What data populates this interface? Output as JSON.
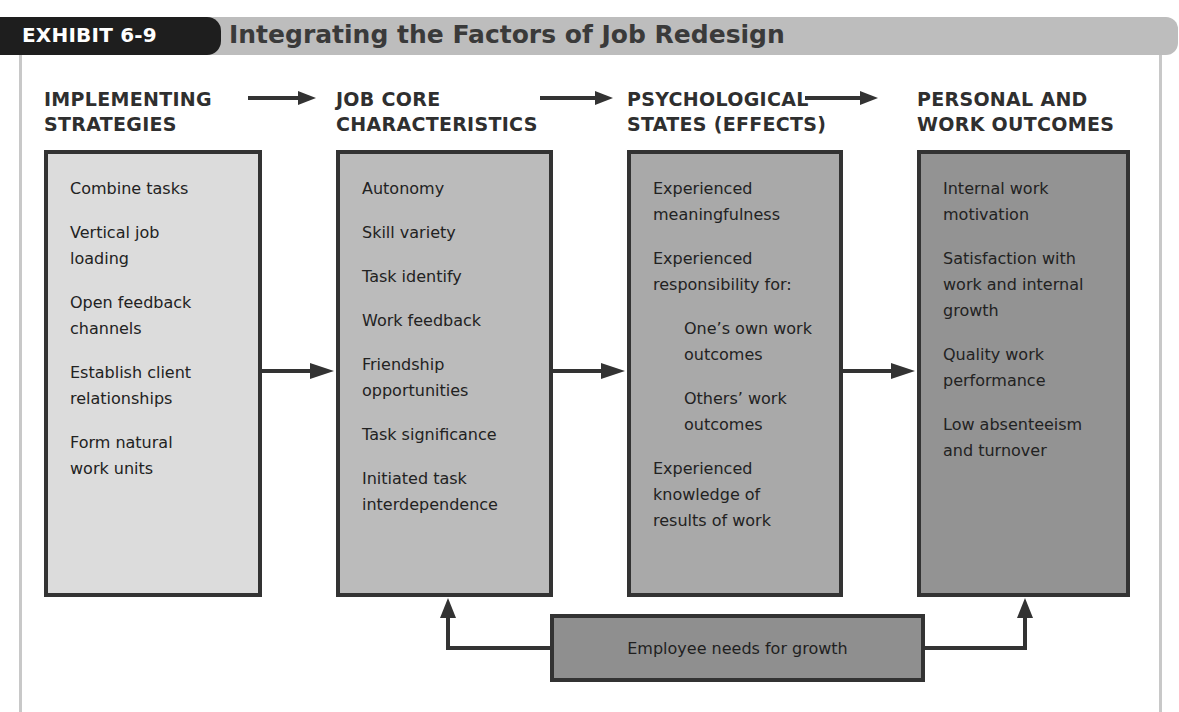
{
  "header": {
    "exhibit_label": "EXHIBIT 6-9",
    "title": "Integrating the Factors of Job Redesign"
  },
  "columns": [
    {
      "heading": "IMPLEMENTING\nSTRATEGIES",
      "items": [
        "Combine tasks",
        "Vertical job\nloading",
        "Open feedback\nchannels",
        "Establish client\nrelationships",
        "Form natural\nwork units"
      ]
    },
    {
      "heading": "JOB CORE\nCHARACTERISTICS",
      "items": [
        "Autonomy",
        "Skill variety",
        "Task identify",
        "Work feedback",
        "Friendship\nopportunities",
        "Task significance",
        "Initiated task\ninterdependence"
      ]
    },
    {
      "heading": "PSYCHOLOGICAL\nSTATES (EFFECTS)",
      "items": [
        "Experienced\nmeaningfulness",
        "Experienced\nresponsibility for:",
        "One’s own work\noutcomes",
        "Others’ work\noutcomes",
        "Experienced\nknowledge of\nresults of work"
      ]
    },
    {
      "heading": "PERSONAL AND\nWORK OUTCOMES",
      "items": [
        "Internal work\nmotivation",
        "Satisfaction with\nwork and internal\ngrowth",
        "Quality work\nperformance",
        "Low absenteeism\nand turnover"
      ]
    }
  ],
  "moderator": {
    "label": "Employee needs for growth"
  },
  "colors": {
    "box1": "#dcdcdc",
    "box2": "#bbbbbb",
    "box3": "#a9a9a9",
    "box4": "#939393",
    "moderator": "#8f8f8f",
    "border": "#333333",
    "header_bar": "#bdbdbd",
    "header_pill": "#1e1e1e"
  }
}
